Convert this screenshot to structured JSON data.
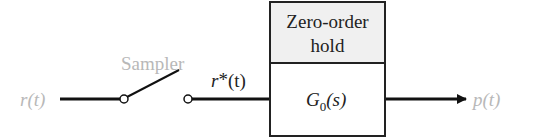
{
  "diagram": {
    "input_label": "r(t)",
    "sampler_label": "Sampler",
    "sampled_label_main": "r",
    "sampled_label_star": "*",
    "sampled_label_arg": "(t)",
    "block": {
      "top_line1": "Zero-order",
      "top_line2": "hold",
      "tf_main": "G",
      "tf_sub": "0",
      "tf_arg": "(s)"
    },
    "output_label": "p(t)"
  },
  "colors": {
    "line": "#111111",
    "faded_text": "#b8b8b8",
    "text": "#222222",
    "block_top_fill": "#f0f0f0",
    "block_bottom_fill": "#ffffff"
  }
}
